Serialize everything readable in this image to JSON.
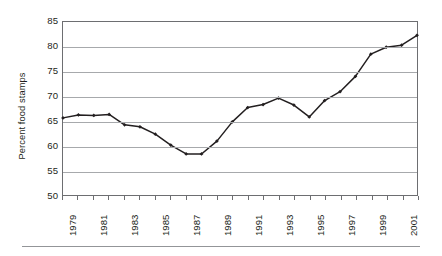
{
  "chart_data": {
    "type": "line",
    "title": "",
    "subtitle": "",
    "xlabel": "",
    "ylabel": "Percent food stamps",
    "ylim": [
      50,
      85
    ],
    "xlim": [
      1979,
      2002
    ],
    "y_ticks": [
      85,
      80,
      75,
      70,
      65,
      60,
      55,
      50
    ],
    "y_tick_labels": [
      "85",
      "80",
      "75",
      "70",
      "65",
      "60",
      "55",
      "50"
    ],
    "x_ticks": [
      1979,
      1980,
      1981,
      1982,
      1983,
      1984,
      1985,
      1986,
      1987,
      1988,
      1989,
      1990,
      1991,
      1992,
      1993,
      1994,
      1995,
      1996,
      1997,
      1998,
      1999,
      2000,
      2001,
      2002
    ],
    "x_tick_labels_shown": [
      "1979",
      "1981",
      "1983",
      "1985",
      "1987",
      "1989",
      "1991",
      "1993",
      "1995",
      "1997",
      "1999",
      "2001"
    ],
    "grid": "horizontal",
    "legend": "none",
    "marker": "diamond",
    "series_color": "#231f20",
    "grid_color": "#a7a9ac",
    "frame_color": "#6d6e71",
    "background_color": "#ffffff",
    "x": [
      1979,
      1980,
      1981,
      1982,
      1983,
      1984,
      1985,
      1986,
      1987,
      1988,
      1989,
      1990,
      1991,
      1992,
      1993,
      1994,
      1995,
      1996,
      1997,
      1998,
      1999,
      2000,
      2001,
      2002
    ],
    "values": [
      65.6,
      66.2,
      66.1,
      66.3,
      64.2,
      63.8,
      62.3,
      60.1,
      58.3,
      58.3,
      60.9,
      64.8,
      67.7,
      68.3,
      69.6,
      68.2,
      65.8,
      69.1,
      70.9,
      74.0,
      78.5,
      79.9,
      80.3,
      82.3
    ]
  }
}
